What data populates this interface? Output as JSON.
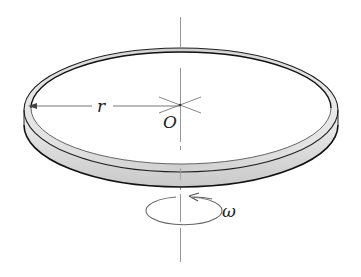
{
  "figure": {
    "labels": {
      "radius": "r",
      "center": "O",
      "angular_velocity": "ω"
    },
    "colors": {
      "background": "#ffffff",
      "ring_fill": "#d9d9d9",
      "ring_highlight": "#eeeeee",
      "ring_edge": "#1a1a1a",
      "axis": "#777777",
      "annotation": "#555555"
    }
  }
}
